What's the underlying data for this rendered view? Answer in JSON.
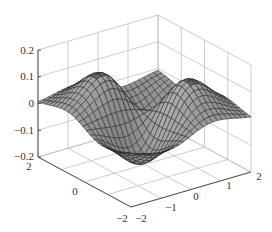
{
  "chart_data": {
    "type": "surface3d",
    "title": "",
    "xlabel": "",
    "ylabel": "",
    "zlabel": "",
    "x_range": [
      -2,
      2
    ],
    "y_range": [
      -2,
      2
    ],
    "z_range": [
      -0.2,
      0.2
    ],
    "x_ticks": [
      "-2",
      "-1",
      "0",
      "1",
      "2"
    ],
    "y_ticks": [
      "-2",
      "0",
      "2"
    ],
    "z_ticks": [
      "-0.2",
      "-0.1",
      "0",
      "0.1",
      "0.2"
    ],
    "grid": true,
    "colormap": "gray",
    "mesh_resolution": 25
  },
  "labels": {
    "z": [
      "0.2",
      "0.1",
      "0",
      "-0.1",
      "-0.2"
    ],
    "y": [
      "2",
      "0",
      "-2"
    ],
    "x": [
      "-2",
      "-1",
      "0",
      "1",
      "2"
    ]
  },
  "colors": {
    "grid": "#bfbfbf",
    "axis": "#404040",
    "background": "#ffffff"
  }
}
